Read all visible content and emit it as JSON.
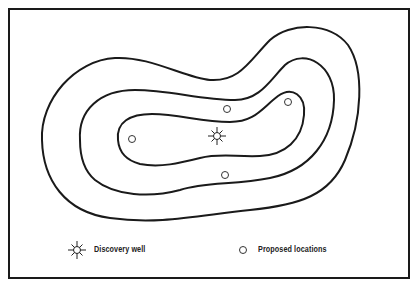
{
  "diagram": {
    "type": "structure contour map",
    "contours": [
      {
        "name": "outer-contour",
        "level": 1
      },
      {
        "name": "middle-contour",
        "level": 2
      },
      {
        "name": "inner-contour",
        "level": 3
      }
    ],
    "discovery_well": {
      "x": 217,
      "y": 136
    },
    "proposed_locations": [
      {
        "x": 227,
        "y": 109
      },
      {
        "x": 288,
        "y": 102
      },
      {
        "x": 132,
        "y": 139
      },
      {
        "x": 225,
        "y": 175
      }
    ],
    "colors": {
      "line": "#1a1a1a",
      "background": "#ffffff"
    }
  },
  "legend": {
    "discovery_well_label": "Discovery well",
    "proposed_locations_label": "Proposed locations",
    "discovery_well_icon": "sun-star-icon",
    "proposed_location_icon": "open-circle-icon"
  }
}
